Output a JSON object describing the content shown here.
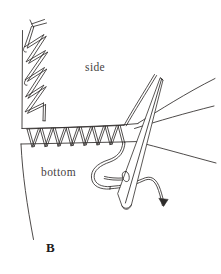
{
  "figure": {
    "panel_letter": "B",
    "caption_labels": {
      "side": "side",
      "bottom": "bottom"
    },
    "background_color": "#ffffff",
    "ink_color": "#2e2c2b",
    "label_color": "#46423f",
    "elements": {
      "vertical_zigzag_stitch": "zigzag-stitch-left-seam",
      "horizontal_loop_stitch": "loop-stitch-bottom-seam",
      "needle": "sewing-needle",
      "needle_eye": "needle-eye",
      "working_thread": "working-thread-loop",
      "thread_tail": "thread-tail",
      "thread_arrow": "thread-direction-arrow",
      "side_panel_edge": "side-panel-fabric-edge",
      "bottom_panel_edge": "bottom-panel-fabric-edge"
    }
  }
}
